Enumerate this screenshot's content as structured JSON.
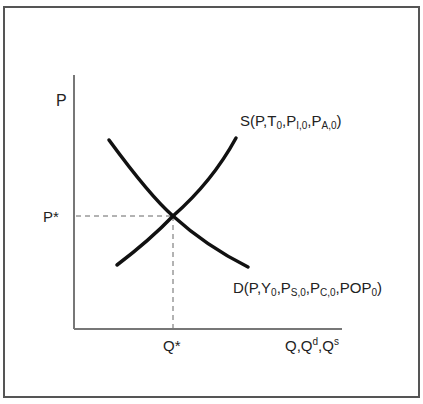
{
  "diagram": {
    "type": "supply-demand",
    "y_axis_label": "P",
    "x_axis_label": {
      "base": "Q,Q",
      "sup1": "d",
      "mid": ",Q",
      "sup2": "s"
    },
    "equilibrium_price_label": "P*",
    "equilibrium_quantity_label": "Q*",
    "supply_label": {
      "prefix": "S(P,T",
      "s1": "0",
      "p2": ",P",
      "s2": "I,0",
      "p3": ",P",
      "s3": "A,0",
      "suffix": ")"
    },
    "demand_label": {
      "prefix": "D(P,Y",
      "s1": "0",
      "p2": ",P",
      "s2": "S,0",
      "p3": ",P",
      "s3": "C,0",
      "p4": ",POP",
      "s4": "0",
      "suffix": ")"
    },
    "colors": {
      "curve": "#111111",
      "axis": "#777777",
      "dashed": "#666666",
      "frame": "#555555"
    }
  }
}
